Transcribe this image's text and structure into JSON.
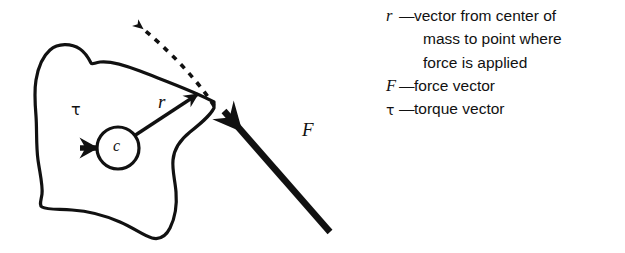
{
  "figure": {
    "stroke_color": "#111111",
    "background_color": "#ffffff"
  },
  "diagram": {
    "body_label": "rigid body outline",
    "center_of_mass": {
      "label": "c",
      "name": "center of mass"
    },
    "vectors": [
      {
        "id": "r",
        "label": "r",
        "name": "position vector",
        "style": "solid",
        "description": "vector from center of mass to point where force is applied"
      },
      {
        "id": "F",
        "label": "F",
        "name": "force vector",
        "style": "thick-solid",
        "description": "force applied at the point on the body edge"
      },
      {
        "id": "tau",
        "label": "τ",
        "name": "torque vector",
        "style": "solid",
        "description": "torque vector pointing left from center of mass"
      },
      {
        "id": "tau-dashed",
        "label": "",
        "name": "torque direction dashed arrow",
        "style": "dashed",
        "description": "dashed arrow indicating rotation sense at application point"
      }
    ]
  },
  "legend": {
    "items": [
      {
        "symbol": "r",
        "symbol_kind": "italic",
        "dash": "—",
        "text": "vector from center of",
        "continuation": [
          "mass to point where",
          "force is applied"
        ]
      },
      {
        "symbol": "F",
        "symbol_kind": "italic",
        "dash": "—",
        "text": "force vector",
        "continuation": []
      },
      {
        "symbol": "τ",
        "symbol_kind": "greek",
        "dash": "—",
        "text": "torque vector",
        "continuation": []
      }
    ]
  }
}
